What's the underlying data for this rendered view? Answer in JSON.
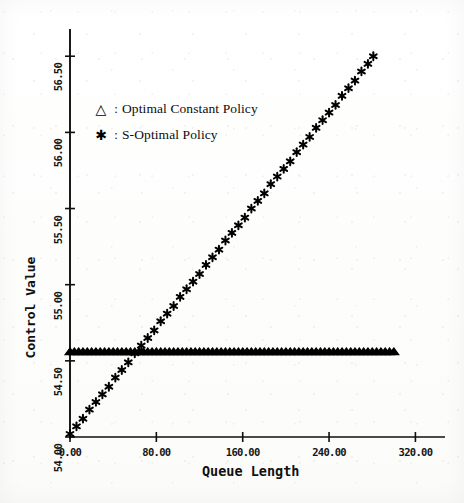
{
  "chart_data": {
    "type": "scatter",
    "title": "",
    "xlabel": "Queue Length",
    "ylabel": "Control Value",
    "xlim": [
      0.0,
      340.0
    ],
    "ylim": [
      54.0,
      56.6
    ],
    "xticks": [
      "0.00",
      "80.00",
      "160.00",
      "240.00",
      "320.00"
    ],
    "xtick_values": [
      0.0,
      80.0,
      160.0,
      240.0,
      320.0
    ],
    "yticks": [
      "54.00",
      "54.50",
      "55.00",
      "55.50",
      "56.00",
      "56.50"
    ],
    "ytick_values": [
      54.0,
      54.5,
      55.0,
      55.5,
      56.0,
      56.5
    ],
    "grid": false,
    "legend_position": "upper-left-inside",
    "series": [
      {
        "name": "Optimal Constant Policy",
        "marker": "triangle",
        "marker_glyph": "△",
        "color": "#000000",
        "x": [
          0,
          4,
          8,
          12,
          16,
          20,
          24,
          28,
          32,
          36,
          40,
          44,
          48,
          52,
          56,
          60,
          64,
          68,
          72,
          76,
          80,
          84,
          88,
          92,
          96,
          100,
          104,
          108,
          112,
          116,
          120,
          124,
          128,
          132,
          136,
          140,
          144,
          148,
          152,
          156,
          160,
          164,
          168,
          172,
          176,
          180,
          184,
          188,
          192,
          196,
          200,
          204,
          208,
          212,
          216,
          220,
          224,
          228,
          232,
          236,
          240,
          244,
          248,
          252,
          256,
          260,
          264,
          268,
          272,
          276,
          280,
          284,
          288,
          292,
          296,
          300
        ],
        "y": [
          54.55,
          54.55,
          54.55,
          54.55,
          54.55,
          54.55,
          54.55,
          54.55,
          54.55,
          54.55,
          54.55,
          54.55,
          54.55,
          54.55,
          54.55,
          54.55,
          54.55,
          54.55,
          54.55,
          54.55,
          54.55,
          54.55,
          54.55,
          54.55,
          54.55,
          54.55,
          54.55,
          54.55,
          54.55,
          54.55,
          54.55,
          54.55,
          54.55,
          54.55,
          54.55,
          54.55,
          54.55,
          54.55,
          54.55,
          54.55,
          54.55,
          54.55,
          54.55,
          54.55,
          54.55,
          54.55,
          54.55,
          54.55,
          54.55,
          54.55,
          54.55,
          54.55,
          54.55,
          54.55,
          54.55,
          54.55,
          54.55,
          54.55,
          54.55,
          54.55,
          54.55,
          54.55,
          54.55,
          54.55,
          54.55,
          54.55,
          54.55,
          54.55,
          54.55,
          54.55,
          54.55,
          54.55,
          54.55,
          54.55,
          54.55,
          54.55
        ]
      },
      {
        "name": "S-Optimal Policy",
        "marker": "star",
        "marker_glyph": "✱",
        "color": "#000000",
        "x": [
          0,
          6,
          12,
          18,
          24,
          30,
          36,
          42,
          48,
          54,
          60,
          66,
          72,
          78,
          84,
          90,
          96,
          102,
          108,
          114,
          120,
          126,
          132,
          138,
          144,
          150,
          156,
          162,
          168,
          174,
          180,
          186,
          192,
          198,
          204,
          210,
          216,
          222,
          228,
          234,
          240,
          246,
          252,
          258,
          264,
          270,
          276,
          281
        ],
        "y": [
          54.02,
          54.07,
          54.12,
          54.18,
          54.23,
          54.28,
          54.33,
          54.39,
          54.44,
          54.49,
          54.55,
          54.6,
          54.65,
          54.7,
          54.76,
          54.81,
          54.86,
          54.92,
          54.97,
          55.02,
          55.07,
          55.13,
          55.18,
          55.23,
          55.29,
          55.34,
          55.39,
          55.44,
          55.5,
          55.55,
          55.6,
          55.66,
          55.71,
          55.76,
          55.81,
          55.87,
          55.92,
          55.97,
          56.03,
          56.08,
          56.13,
          56.18,
          56.24,
          56.29,
          56.34,
          56.4,
          56.45,
          56.5
        ]
      }
    ]
  },
  "legend": {
    "separator": ":",
    "entries": [
      {
        "glyph": "△",
        "icon_name": "triangle-marker-icon",
        "label": "Optimal Constant Policy"
      },
      {
        "glyph": "✱",
        "icon_name": "star-marker-icon",
        "label": "S-Optimal Policy"
      }
    ]
  }
}
